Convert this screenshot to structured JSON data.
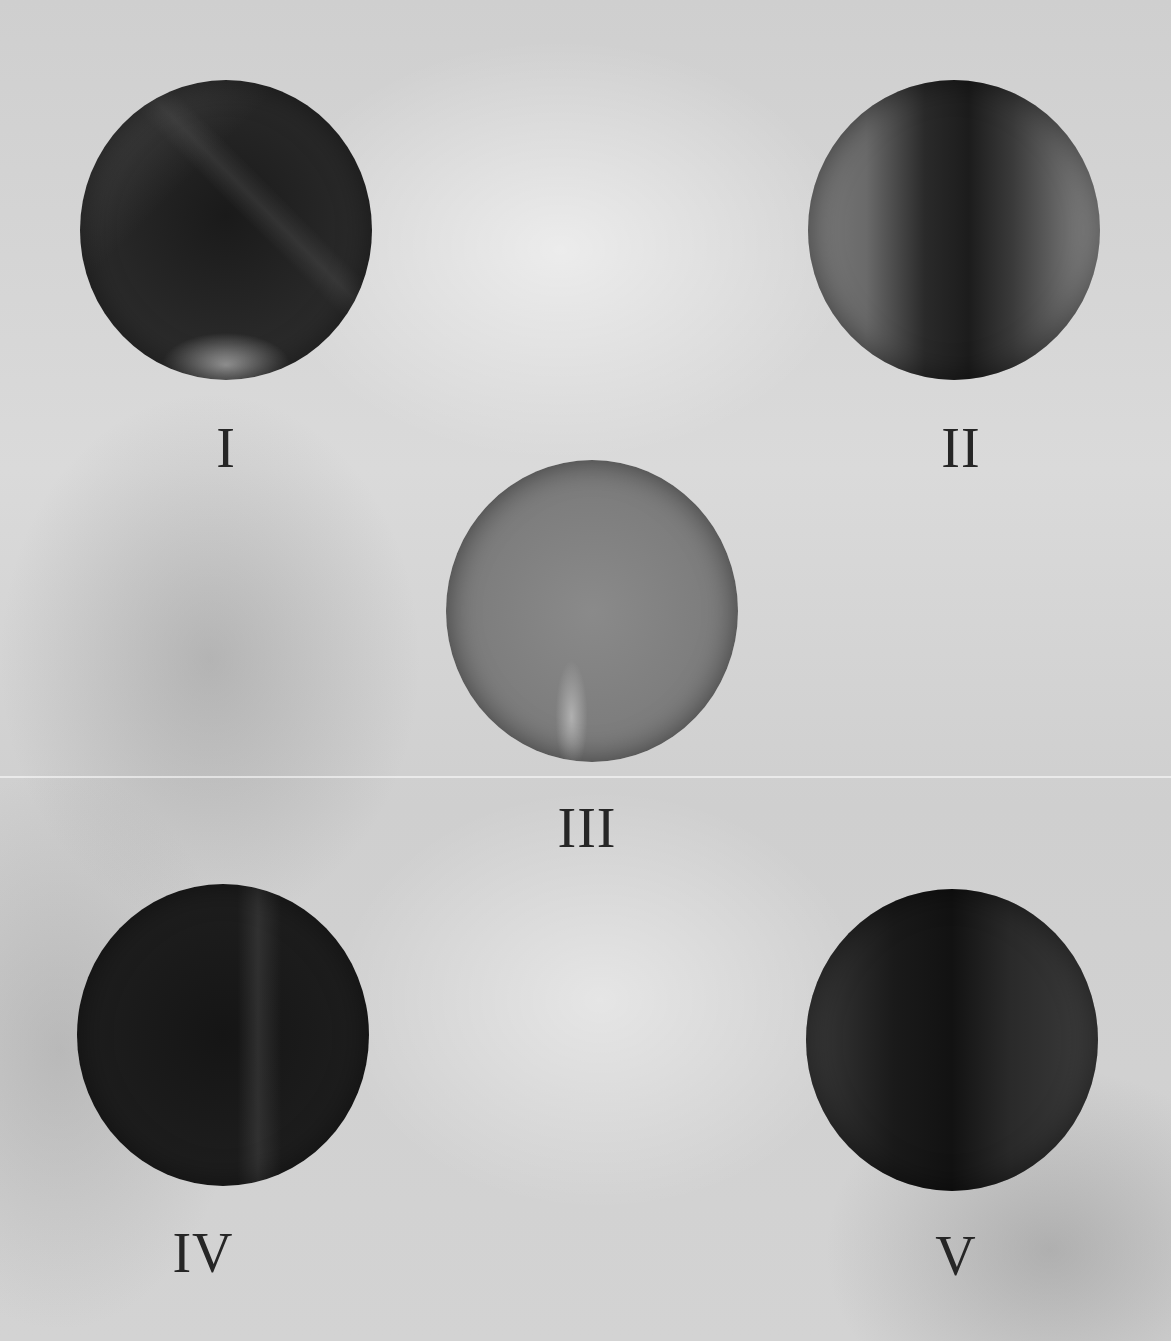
{
  "panels": [
    {
      "label": "I",
      "tone": "dark"
    },
    {
      "label": "II",
      "tone": "medium-dark"
    },
    {
      "label": "III",
      "tone": "medium"
    },
    {
      "label": "IV",
      "tone": "darkest"
    },
    {
      "label": "V",
      "tone": "dark"
    }
  ],
  "colors": {
    "background": "#d6d6d6",
    "numeral": "#262626"
  }
}
